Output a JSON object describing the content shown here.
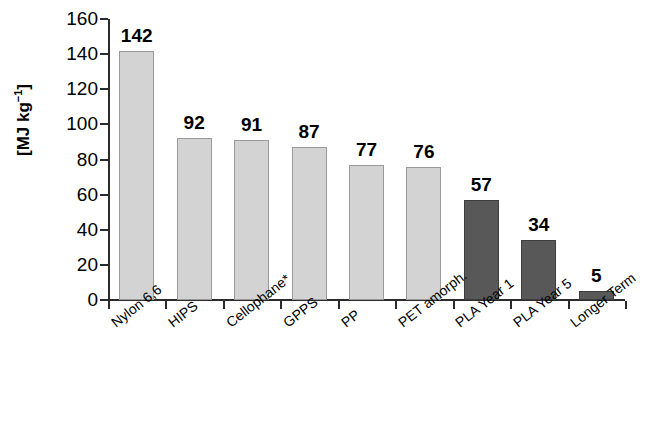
{
  "chart_data": {
    "type": "bar",
    "title": "",
    "subtitle": "",
    "xlabel": "",
    "ylabel": "[MJ kg⁻¹]",
    "ylabel_parts": {
      "prefix": "[MJ kg",
      "sup": "−1",
      "suffix": "]"
    },
    "ylim": [
      0,
      160
    ],
    "yticks": [
      0,
      20,
      40,
      60,
      80,
      100,
      120,
      140,
      160
    ],
    "ytick_labels": [
      "0",
      "20",
      "40",
      "60",
      "80",
      "100",
      "120",
      "140",
      "160"
    ],
    "grid": false,
    "legend": "none",
    "categories": [
      "Nylon 6,6",
      "HIPS",
      "Cellophane*",
      "GPPS",
      "PP",
      "PET amorph.",
      "PLA Year 1",
      "PLA Year 5",
      "Longer Term"
    ],
    "values": [
      142,
      92,
      91,
      87,
      77,
      76,
      57,
      34,
      5
    ],
    "value_labels": [
      "142",
      "92",
      "91",
      "87",
      "77",
      "76",
      "57",
      "34",
      "5"
    ],
    "bar_colors": [
      "#d3d3d3",
      "#d3d3d3",
      "#d3d3d3",
      "#d3d3d3",
      "#d3d3d3",
      "#d3d3d3",
      "#585858",
      "#585858",
      "#585858"
    ],
    "series": [
      {
        "name": "Energy requirement",
        "values": [
          142,
          92,
          91,
          87,
          77,
          76,
          57,
          34,
          5
        ]
      }
    ],
    "colors": {
      "conventional_polymer": "#d3d3d3",
      "pla": "#585858",
      "axis": "#2b2b2b",
      "text": "#000000",
      "background": "#ffffff"
    }
  }
}
